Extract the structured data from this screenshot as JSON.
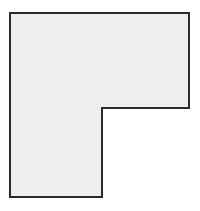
{
  "figure": {
    "shape_name": "l-shape-polygon",
    "background_color": "#ffffff",
    "fill_color": "#ededee",
    "fill_texture": "fine speckled halftone",
    "stroke_color": "#2b2b2b",
    "stroke_width_px": 2,
    "canvas": {
      "width": 200,
      "height": 211
    },
    "vertices": [
      {
        "label": "top-left",
        "x": 10,
        "y": 13
      },
      {
        "label": "top-right",
        "x": 189,
        "y": 13
      },
      {
        "label": "right-lower",
        "x": 189,
        "y": 108
      },
      {
        "label": "notch-inner-corner",
        "x": 102,
        "y": 108
      },
      {
        "label": "leg-bottom-right",
        "x": 102,
        "y": 197
      },
      {
        "label": "bottom-left",
        "x": 10,
        "y": 197
      }
    ],
    "points_attr": "10,13 189,13 189,108 102,108 102,197 10,197",
    "edges": [
      {
        "name": "top-edge",
        "from": "top-left",
        "to": "top-right",
        "orientation": "horizontal",
        "length": 179
      },
      {
        "name": "right-edge",
        "from": "top-right",
        "to": "right-lower",
        "orientation": "vertical",
        "length": 95
      },
      {
        "name": "notch-horizontal-edge",
        "from": "right-lower",
        "to": "notch-inner-corner",
        "orientation": "horizontal",
        "length": 87
      },
      {
        "name": "notch-vertical-edge",
        "from": "notch-inner-corner",
        "to": "leg-bottom-right",
        "orientation": "vertical",
        "length": 89
      },
      {
        "name": "bottom-edge",
        "from": "leg-bottom-right",
        "to": "bottom-left",
        "orientation": "horizontal",
        "length": 92
      },
      {
        "name": "left-edge",
        "from": "bottom-left",
        "to": "top-left",
        "orientation": "vertical",
        "length": 184
      }
    ]
  }
}
